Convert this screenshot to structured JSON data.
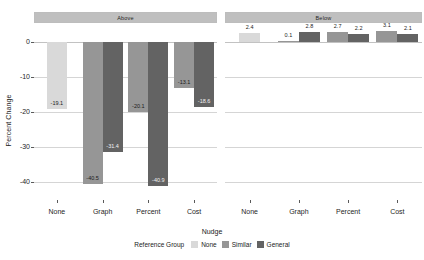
{
  "chart_data": {
    "type": "bar",
    "title": "",
    "xlabel": "Nudge",
    "ylabel": "Percent Change",
    "ylim": [
      -45,
      5
    ],
    "yticks": [
      0,
      -10,
      -20,
      -30,
      -40
    ],
    "ytick_labels": [
      "0",
      "-10",
      "-20",
      "-30",
      "-40"
    ],
    "grid": true,
    "facet_variable": "Reference point",
    "facets": [
      "Above",
      "Below"
    ],
    "categories": [
      "None",
      "Graph",
      "Percent",
      "Cost"
    ],
    "legend": {
      "title": "Reference Group",
      "position": "bottom",
      "entries": [
        {
          "name": "None",
          "color": "#d9d9d9"
        },
        {
          "name": "Similar",
          "color": "#969696"
        },
        {
          "name": "General",
          "color": "#636363"
        }
      ]
    },
    "panels": [
      {
        "facet": "Above",
        "groups": [
          {
            "category": "None",
            "bars": [
              {
                "series": "None",
                "value": -19.1,
                "label": "-19.1"
              }
            ]
          },
          {
            "category": "Graph",
            "bars": [
              {
                "series": "Similar",
                "value": -40.5,
                "label": "-40.5"
              },
              {
                "series": "General",
                "value": -31.4,
                "label": "-31.4"
              }
            ]
          },
          {
            "category": "Percent",
            "bars": [
              {
                "series": "Similar",
                "value": -20.1,
                "label": "-20.1"
              },
              {
                "series": "General",
                "value": -40.9,
                "label": "-40.9"
              }
            ]
          },
          {
            "category": "Cost",
            "bars": [
              {
                "series": "Similar",
                "value": -13.1,
                "label": "-13.1"
              },
              {
                "series": "General",
                "value": -18.6,
                "label": "-18.6"
              }
            ]
          }
        ]
      },
      {
        "facet": "Below",
        "groups": [
          {
            "category": "None",
            "bars": [
              {
                "series": "None",
                "value": 2.4,
                "label": "2.4"
              }
            ]
          },
          {
            "category": "Graph",
            "bars": [
              {
                "series": "Similar",
                "value": 0.1,
                "label": "0.1"
              },
              {
                "series": "General",
                "value": 2.8,
                "label": "2.8"
              }
            ]
          },
          {
            "category": "Percent",
            "bars": [
              {
                "series": "Similar",
                "value": 2.7,
                "label": "2.7"
              },
              {
                "series": "General",
                "value": 2.2,
                "label": "2.2"
              }
            ]
          },
          {
            "category": "Cost",
            "bars": [
              {
                "series": "Similar",
                "value": 3.1,
                "label": "3.1"
              },
              {
                "series": "General",
                "value": 2.1,
                "label": "2.1"
              }
            ]
          }
        ]
      }
    ]
  }
}
